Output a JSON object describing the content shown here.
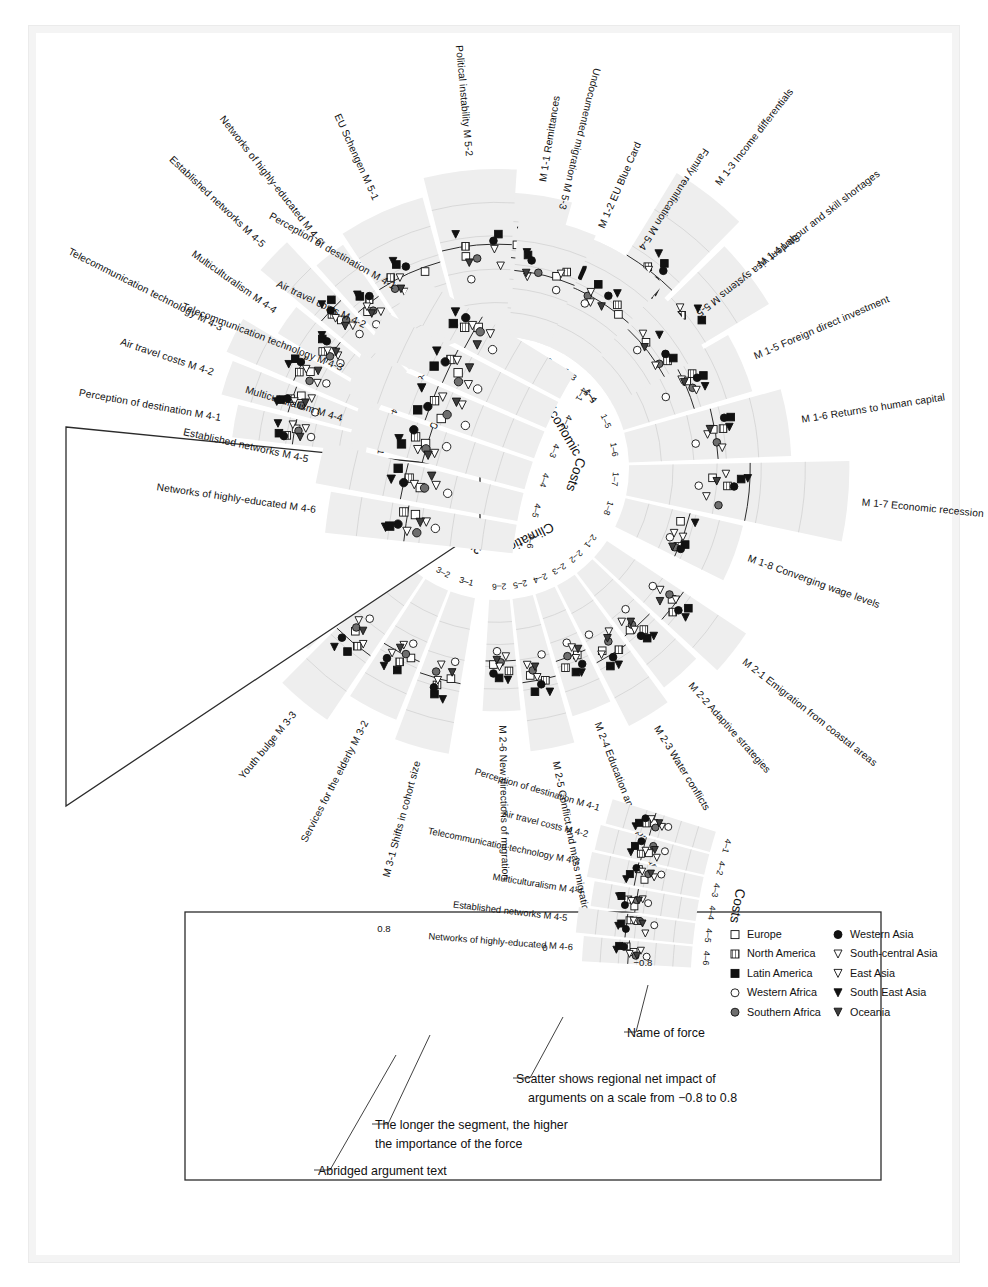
{
  "figure": {
    "background": "#ffffff",
    "band_fill": "#eeeeee",
    "line_color": "#2b2b2b"
  },
  "chart_data": {
    "type": "scatter",
    "title": "",
    "scale_label": "Scatter shows regional net impact of arguments on a scale from −0.8 to 0.8",
    "xlim": [
      -0.8,
      0.8
    ],
    "axis_ticks": [
      "0.8",
      "0",
      "−0.8"
    ],
    "grid": true,
    "legend_position": "inset-bottom-right",
    "series": [
      {
        "name": "Europe",
        "marker": "open-square",
        "fill": "#ffffff"
      },
      {
        "name": "North America",
        "marker": "hatched-square",
        "fill": "#8a8a8a"
      },
      {
        "name": "Latin America",
        "marker": "filled-square",
        "fill": "#111111"
      },
      {
        "name": "Western Africa",
        "marker": "open-circle",
        "fill": "#ffffff"
      },
      {
        "name": "Southern Africa",
        "marker": "filled-circle-grey",
        "fill": "#6e6e6e"
      },
      {
        "name": "Western Asia",
        "marker": "filled-circle",
        "fill": "#111111"
      },
      {
        "name": "South-central Asia",
        "marker": "open-triangle-down",
        "fill": "#ffffff"
      },
      {
        "name": "East Asia",
        "marker": "open-triangle-down2",
        "fill": "#ffffff"
      },
      {
        "name": "South East Asia",
        "marker": "filled-triangle-down",
        "fill": "#111111"
      },
      {
        "name": "Oceania",
        "marker": "filled-triangle-down2",
        "fill": "#4a4a4a"
      }
    ],
    "sectors": [
      {
        "key": "economic",
        "label": "Economic",
        "tick_labels": [
          "1–1",
          "1–2",
          "1–3",
          "1–4",
          "1–5",
          "1–6",
          "1–7",
          "1–8"
        ],
        "forces": [
          {
            "id": "M 1-1",
            "label": "M 1-1 Remittances",
            "importance": 0.62,
            "values": [
              -0.18,
              -0.3,
              -0.42,
              0.05,
              -0.1,
              -0.22,
              -0.26,
              -0.34,
              -0.38,
              -0.14
            ]
          },
          {
            "id": "M 1-2",
            "label": "M 1-2 EU Blue Card",
            "importance": 0.5,
            "values": [
              -0.05,
              -0.2,
              -0.34,
              0.02,
              -0.12,
              -0.24,
              -0.08,
              -0.16,
              -0.28,
              -0.02
            ]
          },
          {
            "id": "M 1-3",
            "label": "M 1-3 Income differentials",
            "importance": 0.92,
            "values": [
              0.1,
              -0.02,
              -0.14,
              0.22,
              0.04,
              -0.08,
              0.16,
              0.0,
              -0.18,
              0.12
            ]
          },
          {
            "id": "M 1-4",
            "label": "M 1-4 Labour and skill shortages",
            "importance": 0.8,
            "values": [
              0.05,
              -0.06,
              -0.2,
              0.3,
              0.12,
              -0.02,
              0.18,
              -0.1,
              -0.24,
              0.08
            ]
          },
          {
            "id": "M 1-5",
            "label": "M 1-5 Foreign direct investment",
            "importance": 0.58,
            "values": [
              -0.04,
              -0.16,
              -0.3,
              0.34,
              -0.08,
              -0.2,
              0.02,
              -0.12,
              -0.26,
              0.0
            ]
          },
          {
            "id": "M 1-6",
            "label": "M 1-6 Returns to human capital",
            "importance": 0.7,
            "values": [
              0.02,
              -0.1,
              -0.22,
              0.26,
              0.0,
              -0.14,
              0.1,
              -0.06,
              -0.18,
              0.06
            ]
          },
          {
            "id": "M 1-7",
            "label": "M 1-7 Economic recession",
            "importance": 0.95,
            "values": [
              0.34,
              0.2,
              0.08,
              0.46,
              0.26,
              0.14,
              0.38,
              0.22,
              0.02,
              0.3
            ]
          },
          {
            "id": "M 1-8",
            "label": "M 1-8 Converging wage levels",
            "importance": 0.52,
            "values": [
              0.12,
              0.02,
              -0.08,
              0.2,
              0.06,
              -0.04,
              0.16,
              0.0,
              -0.12,
              0.1
            ]
          }
        ]
      },
      {
        "key": "climatic",
        "label": "Climatic",
        "tick_labels": [
          "2–1",
          "2–2",
          "2–3",
          "2–4",
          "2–5",
          "2–6"
        ],
        "forces": [
          {
            "id": "M 2-1",
            "label": "M 2-1 Emigration from coastal areas",
            "importance": 0.72,
            "values": [
              0.06,
              -0.04,
              -0.16,
              0.34,
              0.12,
              -0.08,
              0.24,
              0.02,
              -0.2,
              0.16
            ]
          },
          {
            "id": "M 2-2",
            "label": "M 2-2 Adaptive strategies",
            "importance": 0.62,
            "values": [
              0.02,
              -0.1,
              -0.22,
              0.28,
              0.06,
              -0.14,
              0.18,
              -0.02,
              -0.26,
              0.1
            ]
          },
          {
            "id": "M 2-3",
            "label": "M 2-3 Water conflicts",
            "importance": 0.68,
            "values": [
              0.1,
              0.0,
              -0.12,
              0.36,
              0.16,
              -0.04,
              0.26,
              0.06,
              -0.16,
              0.2
            ]
          },
          {
            "id": "M 2-4",
            "label": "M 2-4 Education and adaptive capacity",
            "importance": 0.55,
            "values": [
              -0.02,
              -0.14,
              -0.26,
              0.22,
              0.02,
              -0.18,
              0.12,
              -0.06,
              -0.3,
              0.06
            ]
          },
          {
            "id": "M 2-5",
            "label": "M 2-5 Conflict and mass migration",
            "importance": 0.66,
            "values": [
              0.08,
              -0.02,
              -0.14,
              0.32,
              0.14,
              -0.06,
              0.22,
              0.04,
              -0.18,
              0.18
            ]
          },
          {
            "id": "M 2-6",
            "label": "M 2-6 New directions of migration",
            "importance": 0.48,
            "values": [
              -0.06,
              -0.18,
              -0.3,
              0.18,
              -0.02,
              -0.22,
              0.08,
              -0.1,
              -0.34,
              0.02
            ]
          }
        ]
      },
      {
        "key": "demographic",
        "label": "Demographic",
        "tick_labels": [
          "3–1",
          "3–2",
          "3–3",
          "3–4",
          "3–5"
        ],
        "forces": [
          {
            "id": "M 3-1",
            "label": "M 3-1 Shifts in cohort size",
            "importance": 0.68,
            "values": [
              0.04,
              -0.08,
              -0.2,
              0.26,
              0.08,
              -0.12,
              0.18,
              -0.02,
              -0.24,
              0.12
            ]
          },
          {
            "id": "M 3-2",
            "label": "Services for the elderly M 3-2",
            "importance": 0.6,
            "values": [
              0.0,
              -0.12,
              -0.24,
              0.2,
              0.02,
              -0.16,
              0.12,
              -0.06,
              -0.28,
              0.06
            ]
          },
          {
            "id": "M 3-3",
            "label": "Youth bulge M 3-3",
            "importance": 0.74,
            "values": [
              0.12,
              0.0,
              -0.12,
              0.34,
              0.16,
              -0.04,
              0.24,
              0.06,
              -0.18,
              0.18
            ]
          },
          {
            "id": "M 3-4",
            "label": "Attitudes to immigration M 3-4",
            "importance": 0.56,
            "values": [
              -0.04,
              -0.16,
              -0.28,
              0.22,
              0.0,
              -0.2,
              0.1,
              -0.08,
              -0.32,
              0.04
            ]
          },
          {
            "id": "M 3-5",
            "label": "Migration of highly-educated M 3-5",
            "importance": 0.64,
            "values": [
              0.06,
              -0.06,
              -0.18,
              0.28,
              0.1,
              -0.1,
              0.2,
              0.0,
              -0.22,
              0.14
            ]
          }
        ]
      },
      {
        "key": "costs",
        "label": "Costs",
        "tick_labels": [
          "4–1",
          "4–2",
          "4–3",
          "4–4",
          "4–5",
          "4–6"
        ],
        "forces": [
          {
            "id": "M 4-1",
            "label": "Perception of destination M 4-1",
            "importance": 0.58,
            "values": [
              0.02,
              -0.1,
              -0.22,
              0.26,
              0.06,
              -0.14,
              0.16,
              -0.04,
              -0.26,
              0.1
            ]
          },
          {
            "id": "M 4-2",
            "label": "Air travel costs M 4-2",
            "importance": 0.66,
            "values": [
              0.1,
              -0.02,
              -0.14,
              0.34,
              0.14,
              -0.06,
              0.24,
              0.04,
              -0.18,
              0.18
            ]
          },
          {
            "id": "M 4-3",
            "label": "Telecommunication technology M 4-3",
            "importance": 0.7,
            "values": [
              0.14,
              0.02,
              -0.1,
              0.38,
              0.18,
              -0.02,
              0.28,
              0.08,
              -0.14,
              0.22
            ]
          },
          {
            "id": "M 4-4",
            "label": "Multiculturalism M 4-4",
            "importance": 0.54,
            "values": [
              -0.02,
              -0.14,
              -0.26,
              0.2,
              0.0,
              -0.18,
              0.1,
              -0.08,
              -0.3,
              0.04
            ]
          },
          {
            "id": "M 4-5",
            "label": "Established networks M 4-5",
            "importance": 0.76,
            "values": [
              0.16,
              0.04,
              -0.08,
              0.42,
              0.2,
              0.0,
              0.3,
              0.1,
              -0.12,
              0.24
            ]
          },
          {
            "id": "M 4-6",
            "label": "Networks of highly-educated M 4-6",
            "importance": 0.6,
            "values": [
              0.08,
              -0.04,
              -0.16,
              0.3,
              0.12,
              -0.08,
              0.2,
              0.02,
              -0.2,
              0.14
            ]
          }
        ]
      },
      {
        "key": "policy",
        "label": "Policy",
        "tick_labels": [
          "5–1",
          "5–2",
          "5–3",
          "5–4",
          "5–5"
        ],
        "forces": [
          {
            "id": "M 5-1",
            "label": "EU Schengen M 5-1",
            "importance": 0.64,
            "values": [
              0.06,
              -0.06,
              -0.18,
              0.3,
              0.1,
              -0.1,
              0.2,
              0.0,
              -0.24,
              0.14
            ]
          },
          {
            "id": "M 5-2",
            "label": "Political instability M 5-2",
            "importance": 0.72,
            "values": [
              0.12,
              0.0,
              -0.12,
              0.4,
              0.16,
              -0.04,
              0.26,
              0.06,
              -0.16,
              0.2
            ]
          },
          {
            "id": "M 5-3",
            "label": "Undocumented migration M 5-3",
            "importance": 0.52,
            "values": [
              -0.04,
              -0.16,
              -0.28,
              0.18,
              -0.02,
              -0.2,
              0.08,
              -0.1,
              -0.32,
              0.02
            ]
          },
          {
            "id": "M 5-4",
            "label": "Family reunification M 5-4",
            "importance": 0.5,
            "values": [
              0.0,
              -0.12,
              -0.24,
              0.16,
              0.02,
              -0.16,
              0.1,
              -0.06,
              -0.28,
              0.06
            ]
          },
          {
            "id": "M 5-5",
            "label": "Student visa systems M 5-5",
            "importance": 0.46,
            "values": [
              -0.08,
              -0.2,
              -0.32,
              0.14,
              -0.04,
              -0.24,
              0.04,
              -0.14,
              -0.36,
              0.0
            ]
          }
        ]
      }
    ]
  },
  "callout": {
    "sector_label": "Costs",
    "tick_labels": [
      "4–6",
      "4–5",
      "4–4",
      "4–3",
      "4–2",
      "4–1"
    ],
    "force_labels": [
      "Networks of highly-educated M 4-6",
      "Established networks M 4-5",
      "Multiculturalism M 4-4",
      "Telecommunication technology M 4-3",
      "Air travel costs M 4-2",
      "Perception of destination M 4-1"
    ]
  },
  "legend_panel": {
    "axis_labels": {
      "left": "0.8",
      "mid": "0",
      "right": "−0.8"
    },
    "sector_label": "Costs",
    "tick_labels": [
      "4–6",
      "4–5",
      "4–4",
      "4–3",
      "4–2",
      "4–1"
    ],
    "force_labels": [
      "Networks of highly-educated M 4-6",
      "Established networks M 4-5",
      "Multiculturalism M 4-4",
      "Telecommunication technology M 4-3",
      "Air travel costs M 4-2",
      "Perception of destination M 4-1"
    ],
    "legend_items": [
      {
        "name": "Europe",
        "marker": "open-square"
      },
      {
        "name": "North America",
        "marker": "hatched-square"
      },
      {
        "name": "Latin America",
        "marker": "filled-square"
      },
      {
        "name": "Western Africa",
        "marker": "open-circle"
      },
      {
        "name": "Southern Africa",
        "marker": "filled-circle-grey"
      },
      {
        "name": "Western Asia",
        "marker": "filled-circle"
      },
      {
        "name": "South-central Asia",
        "marker": "open-triangle-down"
      },
      {
        "name": "East Asia",
        "marker": "open-triangle-down2"
      },
      {
        "name": "South East Asia",
        "marker": "filled-triangle-down"
      },
      {
        "name": "Oceania",
        "marker": "filled-triangle-down2"
      }
    ],
    "annotations": [
      {
        "key": "name-of-force",
        "text": "Name of force"
      },
      {
        "key": "scatter-scale",
        "text": "Scatter shows regional net impact of"
      },
      {
        "key": "scatter-scale-2",
        "text": "arguments on a scale from −0.8 to 0.8"
      },
      {
        "key": "segment-length",
        "text": "The longer the segment, the higher"
      },
      {
        "key": "segment-length-2",
        "text": "the importance of the force"
      },
      {
        "key": "abridged",
        "text": "Abridged argument text"
      }
    ]
  }
}
